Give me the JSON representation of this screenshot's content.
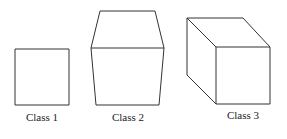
{
  "diagram": {
    "stroke_color": "#333333",
    "shapes": [
      {
        "name": "square",
        "label": "Class 1"
      },
      {
        "name": "truncated-prism",
        "label": "Class 2"
      },
      {
        "name": "cube",
        "label": "Class 3"
      }
    ]
  }
}
